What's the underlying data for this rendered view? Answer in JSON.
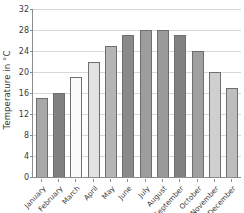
{
  "chart_data": {
    "type": "bar",
    "title": "",
    "xlabel": "",
    "ylabel": "Temperature in °C",
    "ylim": [
      0,
      32
    ],
    "ytick_step": 4,
    "yticks": [
      0,
      4,
      8,
      12,
      16,
      20,
      24,
      28,
      32
    ],
    "grid": true,
    "legend": "none",
    "categories": [
      "January",
      "February",
      "March",
      "April",
      "May",
      "June",
      "July",
      "August",
      "September",
      "October",
      "November",
      "December"
    ],
    "values": [
      15,
      16,
      19,
      22,
      25,
      27,
      28,
      28,
      27,
      24,
      20,
      17
    ],
    "bar_colors": [
      "#a8a8a8",
      "#808080",
      "#fbfbfb",
      "#e2e2e2",
      "#b5b5b5",
      "#8a8a8a",
      "#9d9d9d",
      "#9a9a9a",
      "#828282",
      "#a0a0a0",
      "#cfcfcf",
      "#bdbdbd"
    ],
    "bar_outline_color": "#6e6e6e",
    "axis_color": "#8c8c8c",
    "gridline_color": "#d8d8d8",
    "text_color": "#3a3a3a",
    "background_color": "#ffffff"
  }
}
